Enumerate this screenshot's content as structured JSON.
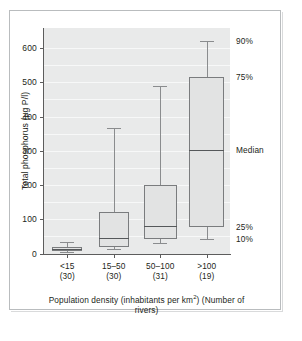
{
  "chart_data": {
    "type": "box",
    "title": "",
    "ylabel": "Total phosphorus (µg P/l)",
    "xlabel_line1": "Population density (inhabitants per km",
    "xlabel_sup": "2",
    "xlabel_line1_end": ")",
    "xlabel_line2": "(Number of rivers)",
    "ylim": [
      0,
      640
    ],
    "yticks": [
      0,
      100,
      200,
      300,
      400,
      500,
      600
    ],
    "ytick_labels": [
      "0",
      "100",
      "200",
      "300",
      "400",
      "500",
      "600"
    ],
    "grid": "horizontal",
    "categories": [
      "<15",
      "15–50",
      "50–100",
      ">100"
    ],
    "counts": [
      "(30)",
      "(30)",
      "(31)",
      "(19)"
    ],
    "boxes": [
      {
        "category": "<15",
        "n": 30,
        "p10": 4,
        "p25": 7,
        "median": 14,
        "p75": 20,
        "p90": 35
      },
      {
        "category": "15–50",
        "n": 30,
        "p25": 20,
        "median": 45,
        "p75": 120,
        "p10": 12,
        "p90": 365
      },
      {
        "category": "50–100",
        "n": 31,
        "p25": 42,
        "median": 80,
        "p75": 200,
        "p10": 32,
        "p90": 490
      },
      {
        "category": ">100",
        "n": 19,
        "p25": 78,
        "median": 303,
        "p75": 515,
        "p10": 42,
        "p90": 620
      }
    ],
    "annotations": [
      {
        "label": "90%",
        "value": 620
      },
      {
        "label": "75%",
        "value": 515
      },
      {
        "label": "Median",
        "value": 303
      },
      {
        "label": "25%",
        "value": 78
      },
      {
        "label": "10%",
        "value": 42
      }
    ],
    "legend_position": "right-inline",
    "colors": {
      "plot_background": "#e9eaea",
      "gridline": "#f7f8f8",
      "box_fill": "#e2e3e3",
      "box_stroke": "#7a7c7e",
      "axis": "#5c5c5c",
      "text": "#231f20",
      "frame": "#b9bcbe",
      "page": "#ffffff"
    }
  }
}
